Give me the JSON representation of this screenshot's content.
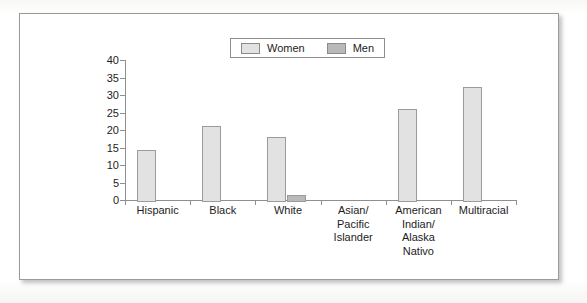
{
  "chart_data": {
    "type": "bar",
    "title": "",
    "xlabel": "",
    "ylabel": "",
    "ylim": [
      0,
      40
    ],
    "yticks": [
      0,
      5,
      10,
      15,
      20,
      25,
      30,
      35,
      40
    ],
    "ytick_labels": [
      "0",
      "5",
      "10",
      "15",
      "20",
      "25",
      "30",
      "35",
      "40"
    ],
    "grid": false,
    "legend_position": "top-center",
    "categories": [
      "Hispanic",
      "Black",
      "White",
      "Asian/ Pacific Islander",
      "American Indian/ Alaska Nativo",
      "Multiracial"
    ],
    "category_label_lines": [
      [
        "Hispanic"
      ],
      [
        "Black"
      ],
      [
        "White"
      ],
      [
        "Asian/",
        "Pacific",
        "Islander"
      ],
      [
        "American",
        "Indian/",
        "Alaska",
        "Nativo"
      ],
      [
        "Multiracial"
      ]
    ],
    "series": [
      {
        "name": "Women",
        "color": "#e2e2e2",
        "values": [
          14.8,
          21.8,
          18.6,
          0,
          26.5,
          33.0
        ]
      },
      {
        "name": "Men",
        "color": "#b9b9b9",
        "values": [
          0,
          0,
          1.9,
          0,
          0,
          0
        ]
      }
    ]
  },
  "legend": {
    "items": [
      {
        "label": "Women",
        "color": "#e2e2e2"
      },
      {
        "label": "Men",
        "color": "#b9b9b9"
      }
    ]
  },
  "colors": {
    "women_fill": "#e2e2e2",
    "men_fill": "#b9b9b9",
    "axis": "#8f8f8f",
    "text": "#1d1d1d",
    "frame_border": "#9a9a9a"
  }
}
